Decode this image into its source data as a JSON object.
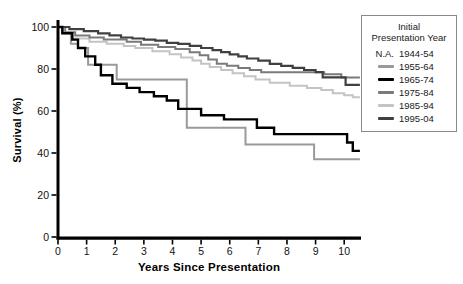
{
  "chart_data": {
    "type": "line",
    "subtype": "kaplan-meier-step",
    "title": "",
    "xlabel": "Years Since Presentation",
    "ylabel": "Survival (%)",
    "xlim": [
      0,
      10.6
    ],
    "ylim": [
      0,
      100
    ],
    "x_ticks": [
      0,
      1,
      2,
      3,
      4,
      5,
      6,
      7,
      8,
      9,
      10
    ],
    "y_ticks": [
      0,
      20,
      40,
      60,
      80,
      100
    ],
    "grid": false,
    "axis_color": "#000000",
    "legend": {
      "position": "outside-right",
      "title_line1": "Initial",
      "title_line2": "Presentation Year",
      "entries": [
        {
          "label": "1944-54",
          "swatch_text": "N.A.",
          "color": null
        },
        {
          "label": "1955-64",
          "swatch_text": null,
          "color": "#9a9a9a"
        },
        {
          "label": "1965-74",
          "swatch_text": null,
          "color": "#000000"
        },
        {
          "label": "1975-84",
          "swatch_text": null,
          "color": "#7a7a7a"
        },
        {
          "label": "1985-94",
          "swatch_text": null,
          "color": "#c4c4c4"
        },
        {
          "label": "1995-04",
          "swatch_text": null,
          "color": "#404040"
        }
      ]
    },
    "series": [
      {
        "name": "1985-94",
        "color": "#c4c4c4",
        "stroke_width": 2,
        "points": [
          [
            0,
            100
          ],
          [
            0.15,
            97
          ],
          [
            0.5,
            94.5
          ],
          [
            1.1,
            93
          ],
          [
            1.7,
            92
          ],
          [
            2.3,
            91
          ],
          [
            2.7,
            90
          ],
          [
            3.3,
            88.5
          ],
          [
            3.9,
            87
          ],
          [
            4.3,
            85.5
          ],
          [
            4.7,
            84
          ],
          [
            5.0,
            82.5
          ],
          [
            5.3,
            81
          ],
          [
            5.7,
            79.5
          ],
          [
            6.1,
            78
          ],
          [
            6.5,
            76.5
          ],
          [
            6.9,
            75
          ],
          [
            7.4,
            73.5
          ],
          [
            8.1,
            72
          ],
          [
            8.7,
            71
          ],
          [
            9.2,
            70
          ],
          [
            9.6,
            68.5
          ],
          [
            10.0,
            67.5
          ],
          [
            10.3,
            66.5
          ],
          [
            10.55,
            66.5
          ]
        ]
      },
      {
        "name": "1975-84",
        "color": "#7a7a7a",
        "stroke_width": 2,
        "points": [
          [
            0,
            100
          ],
          [
            0.25,
            97.5
          ],
          [
            0.6,
            96
          ],
          [
            1.1,
            95
          ],
          [
            1.6,
            94
          ],
          [
            2.4,
            93
          ],
          [
            2.9,
            91.5
          ],
          [
            3.5,
            90.5
          ],
          [
            4.1,
            89.5
          ],
          [
            4.6,
            88
          ],
          [
            4.95,
            86.5
          ],
          [
            5.25,
            84.5
          ],
          [
            5.55,
            82.5
          ],
          [
            5.9,
            81.5
          ],
          [
            6.3,
            80.5
          ],
          [
            6.7,
            79.5
          ],
          [
            7.1,
            78.5
          ],
          [
            9.3,
            77.5
          ],
          [
            9.9,
            76
          ],
          [
            10.55,
            76
          ]
        ]
      },
      {
        "name": "1955-64",
        "color": "#9a9a9a",
        "stroke_width": 2,
        "points": [
          [
            0,
            100
          ],
          [
            0.2,
            97
          ],
          [
            0.45,
            92
          ],
          [
            0.7,
            90
          ],
          [
            1.05,
            82
          ],
          [
            2.05,
            75
          ],
          [
            4.5,
            52
          ],
          [
            6.55,
            44
          ],
          [
            8.95,
            37
          ],
          [
            10.55,
            37
          ]
        ]
      },
      {
        "name": "1995-04",
        "color": "#404040",
        "stroke_width": 2.2,
        "points": [
          [
            0,
            100
          ],
          [
            0.4,
            99
          ],
          [
            0.9,
            98
          ],
          [
            1.4,
            97
          ],
          [
            1.8,
            96
          ],
          [
            2.2,
            95
          ],
          [
            2.6,
            94.5
          ],
          [
            3.0,
            94
          ],
          [
            3.4,
            93.5
          ],
          [
            3.8,
            92.5
          ],
          [
            4.2,
            92
          ],
          [
            4.6,
            91
          ],
          [
            5.0,
            90
          ],
          [
            5.4,
            89
          ],
          [
            5.7,
            88
          ],
          [
            6.0,
            87
          ],
          [
            6.3,
            86
          ],
          [
            6.6,
            85
          ],
          [
            7.0,
            84
          ],
          [
            7.4,
            82.5
          ],
          [
            7.8,
            81.5
          ],
          [
            8.2,
            80.5
          ],
          [
            8.6,
            79.5
          ],
          [
            9.0,
            78.5
          ],
          [
            9.25,
            76
          ],
          [
            10.05,
            72.5
          ],
          [
            10.55,
            72.5
          ]
        ]
      },
      {
        "name": "1965-74",
        "color": "#000000",
        "stroke_width": 2.4,
        "points": [
          [
            0,
            100
          ],
          [
            0.15,
            97
          ],
          [
            0.5,
            94
          ],
          [
            0.7,
            90
          ],
          [
            0.95,
            86
          ],
          [
            1.3,
            82
          ],
          [
            1.5,
            77
          ],
          [
            1.9,
            73
          ],
          [
            2.4,
            71
          ],
          [
            2.85,
            69
          ],
          [
            3.35,
            67
          ],
          [
            3.8,
            65
          ],
          [
            4.2,
            61
          ],
          [
            5.0,
            58
          ],
          [
            5.8,
            56
          ],
          [
            6.95,
            52
          ],
          [
            7.55,
            49
          ],
          [
            10.1,
            45
          ],
          [
            10.3,
            41
          ],
          [
            10.55,
            41
          ]
        ]
      }
    ]
  }
}
